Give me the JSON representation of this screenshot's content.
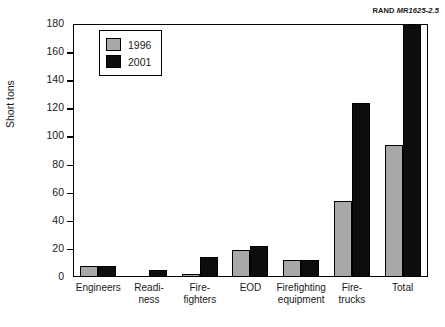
{
  "figure_label": {
    "org": "RAND",
    "doc_number": "MR1625-2.5"
  },
  "legend": {
    "entries": [
      {
        "label": "1996",
        "color": "#a8a8a8"
      },
      {
        "label": "2001",
        "color": "#0d0d0d"
      }
    ]
  },
  "chart_data": {
    "type": "bar",
    "title": "",
    "xlabel": "",
    "ylabel": "Short tons",
    "ylim": [
      0,
      180
    ],
    "ytick_values": [
      0,
      20,
      40,
      60,
      80,
      100,
      120,
      140,
      160,
      180
    ],
    "ytick_labels": [
      "0",
      "20",
      "40",
      "60",
      "80",
      "100",
      "120",
      "140",
      "160",
      "180"
    ],
    "grid": false,
    "legend_position": "top-left-inside",
    "categories": [
      "Engineers",
      "Readi-\nness",
      "Fire-\nfighters",
      "EOD",
      "Firefighting\nequipment",
      "Fire-\ntrucks",
      "Total"
    ],
    "series": [
      {
        "name": "1996",
        "color": "#a8a8a8",
        "values": [
          8,
          0,
          2,
          19,
          12,
          54,
          94
        ]
      },
      {
        "name": "2001",
        "color": "#0d0d0d",
        "values": [
          8,
          5,
          14,
          22,
          12,
          124,
          180
        ]
      }
    ]
  }
}
